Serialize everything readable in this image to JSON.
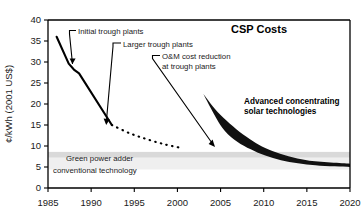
{
  "chart_data": {
    "type": "line",
    "title": "CSP Costs",
    "xlabel": "",
    "ylabel": "¢/kWh (2001 US$)",
    "xlim": [
      1985,
      2020
    ],
    "ylim": [
      0,
      40
    ],
    "xticks": [
      1985,
      1990,
      1995,
      2000,
      2005,
      2010,
      2015,
      2020
    ],
    "yticks": [
      0,
      5,
      10,
      15,
      20,
      25,
      30,
      35,
      40
    ],
    "grid": false,
    "legend": "none",
    "series": [
      {
        "name": "Historical trough plant costs (solid)",
        "style": "solid",
        "x": [
          1986.0,
          1987.4,
          1988.0,
          1988.6,
          1992.4
        ],
        "y": [
          36.0,
          29.6,
          28.2,
          27.3,
          15.0
        ]
      },
      {
        "name": "Projected trough plant costs (dotted)",
        "style": "dotted",
        "x": [
          1992.4,
          1994.5,
          1996.5,
          1998.5,
          2000.3
        ],
        "y": [
          15.0,
          13.0,
          11.6,
          10.4,
          9.6
        ]
      },
      {
        "name": "Advanced concentrating solar technologies (wedge upper bound)",
        "style": "filled-wedge-upper",
        "x": [
          2003.0,
          2005.0,
          2008.0,
          2011.0,
          2015.0,
          2020.0
        ],
        "y": [
          22.4,
          17.4,
          12.2,
          8.8,
          6.6,
          5.8
        ]
      },
      {
        "name": "Advanced concentrating solar technologies (wedge lower bound)",
        "style": "filled-wedge-lower",
        "x": [
          2003.0,
          2005.5,
          2008.5,
          2012.0,
          2016.0,
          2020.0
        ],
        "y": [
          22.4,
          13.6,
          9.2,
          6.6,
          5.4,
          5.0
        ]
      }
    ],
    "bands": [
      {
        "name": "green-power-adder-band",
        "y_low": 7.2,
        "y_high": 8.6,
        "color": "#d9d9d9"
      },
      {
        "name": "conventional-technology-band",
        "y_low": 4.4,
        "y_high": 7.2,
        "color": "#efefef"
      }
    ],
    "annotations": [
      {
        "name": "initial-trough-plants",
        "text": "Initial trough plants",
        "points_to_x": 1987.6,
        "points_to_y": 29.0
      },
      {
        "name": "larger-trough-plants",
        "text": "Larger trough plants",
        "points_to_x": 1992.0,
        "points_to_y": 16.6
      },
      {
        "name": "om-cost-reduction-line1",
        "text": "O&M cost reduction",
        "points_to_x": 2000.6,
        "points_to_y": 9.9
      },
      {
        "name": "om-cost-reduction-line2",
        "text": "at trough plants",
        "points_to_x": 2000.6,
        "points_to_y": 9.9
      },
      {
        "name": "advanced-solar-line1",
        "text": "Advanced concentrating",
        "points_to_x": null,
        "points_to_y": null
      },
      {
        "name": "advanced-solar-line2",
        "text": "solar technologies",
        "points_to_x": null,
        "points_to_y": null
      },
      {
        "name": "green-power-adder",
        "text": "Green power adder",
        "points_to_x": null,
        "points_to_y": null
      },
      {
        "name": "conventional-technology",
        "text": "conventional technology",
        "points_to_x": null,
        "points_to_y": null
      }
    ]
  },
  "axis": {
    "y_title": "¢/kWh (2001 US$)",
    "y_tick_labels": [
      "40",
      "35",
      "30",
      "25",
      "20",
      "15",
      "10",
      "5",
      "0"
    ],
    "x_tick_labels": [
      "1985",
      "1990",
      "1995",
      "2000",
      "2005",
      "2010",
      "2015",
      "2020"
    ]
  },
  "title": {
    "text": "CSP Costs"
  },
  "labels": {
    "initial_trough": "Initial trough plants",
    "larger_trough": "Larger trough plants",
    "om_line1": "O&M cost reduction",
    "om_line2": "at trough plants",
    "advanced_line1": "Advanced concentrating",
    "advanced_line2": "solar technologies",
    "green_power_adder": "Green power adder",
    "conventional_technology": "conventional technology"
  },
  "colors": {
    "axis": "#000000",
    "curve": "#000000",
    "wedge": "#111111",
    "band_upper": "#d9d9d9",
    "band_lower": "#efefef",
    "text": "#1a1a1a"
  }
}
